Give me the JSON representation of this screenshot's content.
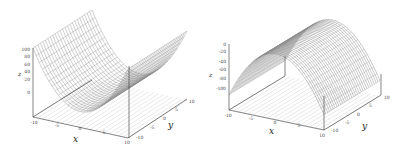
{
  "chart_data": [
    {
      "type": "surface3d",
      "title": "",
      "function": "z = x^2",
      "xlabel": "x",
      "ylabel": "y",
      "zlabel": "z",
      "xlim": [
        -10,
        10
      ],
      "ylim": [
        -10,
        10
      ],
      "zlim": [
        0,
        100
      ],
      "x_ticks": [
        "-10",
        "-5",
        "0",
        "5",
        "10"
      ],
      "y_ticks": [
        "-10",
        "-5",
        "0",
        "5",
        "10"
      ],
      "z_ticks": [
        "0",
        "20",
        "40",
        "60",
        "80",
        "100"
      ],
      "contour_projection": true,
      "grid": false,
      "shape": "parabolic trough opening upward (valley along y-axis)"
    },
    {
      "type": "surface3d",
      "title": "",
      "function": "z = -x^2",
      "xlabel": "x",
      "ylabel": "y",
      "zlabel": "z",
      "xlim": [
        -10,
        10
      ],
      "ylim": [
        -10,
        10
      ],
      "zlim": [
        -100,
        0
      ],
      "x_ticks": [
        "-10",
        "-5",
        "0",
        "5",
        "10"
      ],
      "y_ticks": [
        "-10",
        "-5",
        "0",
        "5",
        "10"
      ],
      "z_ticks": [
        "-100",
        "-80",
        "-60",
        "-40",
        "-20",
        "0"
      ],
      "contour_projection": true,
      "grid": false,
      "shape": "parabolic ridge opening downward (ridge along y-axis)"
    }
  ],
  "labels": {
    "left": {
      "x": "x",
      "y": "y",
      "z": "z",
      "xt": [
        "-10",
        "-5",
        "0",
        "5",
        "10"
      ],
      "yt": [
        "-10",
        "-5",
        "0",
        "5",
        "10"
      ],
      "zt": [
        "100",
        "80",
        "60",
        "40",
        "20",
        "0"
      ]
    },
    "right": {
      "x": "x",
      "y": "y",
      "z": "z",
      "xt": [
        "-10",
        "-5",
        "0",
        "5",
        "10"
      ],
      "yt": [
        "-10",
        "-5",
        "0",
        "5",
        "10"
      ],
      "zt": [
        "0",
        "-20",
        "-40",
        "-60",
        "-80",
        "-100"
      ]
    }
  }
}
